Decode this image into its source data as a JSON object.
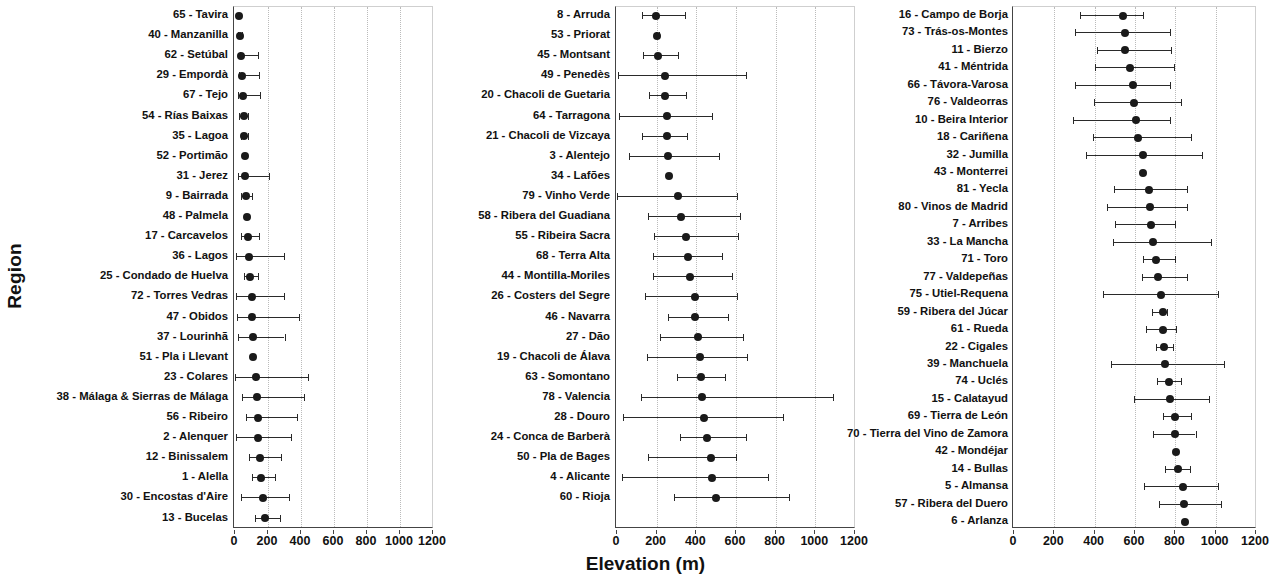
{
  "chart_data": {
    "type": "scatter",
    "title": "",
    "xlabel": "Elevation (m)",
    "ylabel": "Region",
    "xlim": [
      0,
      1200
    ],
    "xticks": [
      0,
      200,
      400,
      600,
      800,
      1000,
      1200
    ],
    "grid": true,
    "legend": null,
    "panels": [
      {
        "index": 1,
        "rows": [
          {
            "label": "65 - Tavira",
            "value": 25,
            "low": 25,
            "high": 25
          },
          {
            "label": "40 - Manzanilla",
            "value": 30,
            "low": 18,
            "high": 42
          },
          {
            "label": "62 - Setúbal",
            "value": 38,
            "low": 32,
            "high": 140
          },
          {
            "label": "29 - Empordà",
            "value": 45,
            "low": 22,
            "high": 145
          },
          {
            "label": "67 - Tejo",
            "value": 48,
            "low": 20,
            "high": 150
          },
          {
            "label": "54 - Rías Baixas",
            "value": 52,
            "low": 25,
            "high": 80
          },
          {
            "label": "35 - Lagoa",
            "value": 55,
            "low": 35,
            "high": 80
          },
          {
            "label": "52 - Portimão",
            "value": 58,
            "low": 58,
            "high": 58
          },
          {
            "label": "31 - Jerez",
            "value": 62,
            "low": 20,
            "high": 205
          },
          {
            "label": "9 - Bairrada",
            "value": 68,
            "low": 38,
            "high": 105
          },
          {
            "label": "48 - Palmela",
            "value": 72,
            "low": 72,
            "high": 72
          },
          {
            "label": "17 - Carcavelos",
            "value": 78,
            "low": 35,
            "high": 145
          },
          {
            "label": "36 - Lagos",
            "value": 85,
            "low": 5,
            "high": 295
          },
          {
            "label": "25 - Condado de Huelva",
            "value": 92,
            "low": 55,
            "high": 140
          },
          {
            "label": "72 - Torres Vedras",
            "value": 100,
            "low": 8,
            "high": 295
          },
          {
            "label": "47 - Obidos",
            "value": 105,
            "low": 10,
            "high": 385
          },
          {
            "label": "37 - Lourinhã",
            "value": 108,
            "low": 18,
            "high": 300
          },
          {
            "label": "51 - Pla i Llevant",
            "value": 110,
            "low": 110,
            "high": 110
          },
          {
            "label": "23 - Colares",
            "value": 130,
            "low": 2,
            "high": 440
          },
          {
            "label": "38 - Málaga & Sierras de Málaga",
            "value": 132,
            "low": 40,
            "high": 420
          },
          {
            "label": "56 - Ribeiro",
            "value": 138,
            "low": 65,
            "high": 375
          },
          {
            "label": "2 - Alenquer",
            "value": 142,
            "low": 5,
            "high": 340
          },
          {
            "label": "12 - Binissalem",
            "value": 150,
            "low": 85,
            "high": 280
          },
          {
            "label": "1 - Alella",
            "value": 158,
            "low": 105,
            "high": 240
          },
          {
            "label": "30 - Encostas d'Aire",
            "value": 168,
            "low": 35,
            "high": 325
          },
          {
            "label": "13 - Bucelas",
            "value": 180,
            "low": 120,
            "high": 270
          }
        ]
      },
      {
        "index": 2,
        "rows": [
          {
            "label": "8 - Arruda",
            "value": 195,
            "low": 125,
            "high": 345
          },
          {
            "label": "53 - Priorat",
            "value": 200,
            "low": 195,
            "high": 212
          },
          {
            "label": "45 - Montsant",
            "value": 205,
            "low": 130,
            "high": 310
          },
          {
            "label": "49 - Penedès",
            "value": 240,
            "low": 5,
            "high": 650
          },
          {
            "label": "20 - Chacoli de Guetaria",
            "value": 240,
            "low": 160,
            "high": 350
          },
          {
            "label": "64 - Tarragona",
            "value": 250,
            "low": 10,
            "high": 480
          },
          {
            "label": "21 - Chacoli de Vizcaya",
            "value": 252,
            "low": 125,
            "high": 355
          },
          {
            "label": "3 - Alentejo",
            "value": 258,
            "low": 60,
            "high": 515
          },
          {
            "label": "34 - Lafões",
            "value": 262,
            "low": 262,
            "high": 262
          },
          {
            "label": "79 - Vinho Verde",
            "value": 308,
            "low": 2,
            "high": 605
          },
          {
            "label": "58 - Ribera del Guadiana",
            "value": 325,
            "low": 155,
            "high": 620
          },
          {
            "label": "55 - Ribeira Sacra",
            "value": 350,
            "low": 185,
            "high": 610
          },
          {
            "label": "68 - Terra Alta",
            "value": 358,
            "low": 180,
            "high": 530
          },
          {
            "label": "44 - Montilla-Moriles",
            "value": 370,
            "low": 180,
            "high": 580
          },
          {
            "label": "26 - Costers del Segre",
            "value": 392,
            "low": 140,
            "high": 605
          },
          {
            "label": "46 - Navarra",
            "value": 395,
            "low": 255,
            "high": 560
          },
          {
            "label": "27 - Dão",
            "value": 410,
            "low": 215,
            "high": 635
          },
          {
            "label": "19 - Chacoli de Álava",
            "value": 420,
            "low": 150,
            "high": 655
          },
          {
            "label": "63 - Somontano",
            "value": 425,
            "low": 300,
            "high": 545
          },
          {
            "label": "78 - Valencia",
            "value": 430,
            "low": 120,
            "high": 1090
          },
          {
            "label": "28 - Douro",
            "value": 438,
            "low": 30,
            "high": 835
          },
          {
            "label": "24 - Conca de Barberà",
            "value": 455,
            "low": 320,
            "high": 650
          },
          {
            "label": "50 - Pla de Bages",
            "value": 475,
            "low": 155,
            "high": 600
          },
          {
            "label": "4 - Alicante",
            "value": 480,
            "low": 25,
            "high": 760
          },
          {
            "label": "60 - Rioja",
            "value": 500,
            "low": 285,
            "high": 865
          }
        ]
      },
      {
        "index": 3,
        "rows": [
          {
            "label": "16 - Campo de Borja",
            "value": 540,
            "low": 325,
            "high": 640
          },
          {
            "label": "73 - Trás-os-Montes",
            "value": 550,
            "low": 300,
            "high": 775
          },
          {
            "label": "11 - Bierzo",
            "value": 552,
            "low": 410,
            "high": 780
          },
          {
            "label": "41 - Méntrida",
            "value": 575,
            "low": 400,
            "high": 795
          },
          {
            "label": "66 - Távora-Varosa",
            "value": 588,
            "low": 300,
            "high": 775
          },
          {
            "label": "76 - Valdeorras",
            "value": 595,
            "low": 395,
            "high": 830
          },
          {
            "label": "10 - Beira Interior",
            "value": 605,
            "low": 295,
            "high": 775
          },
          {
            "label": "18 - Cariñena",
            "value": 615,
            "low": 390,
            "high": 880
          },
          {
            "label": "32 - Jumilla",
            "value": 640,
            "low": 355,
            "high": 930
          },
          {
            "label": "43 - Monterrei",
            "value": 640,
            "low": 640,
            "high": 640
          },
          {
            "label": "81 - Yecla",
            "value": 668,
            "low": 495,
            "high": 860
          },
          {
            "label": "80 - Vinos de Madrid",
            "value": 672,
            "low": 460,
            "high": 860
          },
          {
            "label": "7 - Arribes",
            "value": 678,
            "low": 500,
            "high": 800
          },
          {
            "label": "33 - La Mancha",
            "value": 690,
            "low": 490,
            "high": 975
          },
          {
            "label": "71 - Toro",
            "value": 705,
            "low": 640,
            "high": 800
          },
          {
            "label": "77 - Valdepeñas",
            "value": 715,
            "low": 635,
            "high": 860
          },
          {
            "label": "75 - Utiel-Requena",
            "value": 730,
            "low": 440,
            "high": 1010
          },
          {
            "label": "59 - Ribera del Júcar",
            "value": 738,
            "low": 685,
            "high": 760
          },
          {
            "label": "61 - Rueda",
            "value": 740,
            "low": 655,
            "high": 805
          },
          {
            "label": "22 - Cigales",
            "value": 745,
            "low": 705,
            "high": 790
          },
          {
            "label": "39 - Manchuela",
            "value": 748,
            "low": 480,
            "high": 1040
          },
          {
            "label": "74 - Uclés",
            "value": 768,
            "low": 710,
            "high": 830
          },
          {
            "label": "15 - Calatayud",
            "value": 775,
            "low": 595,
            "high": 965
          },
          {
            "label": "69 - Tierra de León",
            "value": 798,
            "low": 740,
            "high": 880
          },
          {
            "label": "70 - Tierra del Vino de Zamora",
            "value": 800,
            "low": 690,
            "high": 900
          },
          {
            "label": "42 - Mondéjar",
            "value": 805,
            "low": 805,
            "high": 805
          },
          {
            "label": "14 - Bullas",
            "value": 815,
            "low": 750,
            "high": 875
          },
          {
            "label": "5 - Almansa",
            "value": 840,
            "low": 645,
            "high": 1010
          },
          {
            "label": "57 - Ribera del Duero",
            "value": 845,
            "low": 720,
            "high": 1025
          },
          {
            "label": "6 - Arlanza",
            "value": 850,
            "low": 850,
            "high": 850
          }
        ]
      }
    ]
  },
  "colors": {
    "marker": "#1a1a1a",
    "errorbar": "#2a2a2a",
    "grid": "#bbbbbb",
    "axis": "#444444",
    "background": "#ffffff"
  }
}
